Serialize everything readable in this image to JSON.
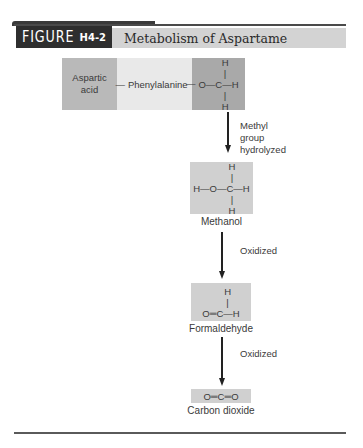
{
  "figure": {
    "label_word": "FIGURE",
    "label_number": "H4-2",
    "title": "Metabolism of Aspartame"
  },
  "aspartame": {
    "segment_1": "Aspartic\nacid",
    "bond_1": "—",
    "segment_2": "Phenylalanine",
    "bond_2": "—",
    "methyl_ester": "     H\n     |\nO—C—H\n     |\n     H"
  },
  "steps": [
    {
      "note": "Methyl\ngroup\nhydrolyzed"
    },
    {
      "note": "Oxidized"
    },
    {
      "note": "Oxidized"
    }
  ],
  "products": [
    {
      "name": "Methanol",
      "structure": "        H\n        |\nH—O—C—H\n        |\n        H"
    },
    {
      "name": "Formaldehyde",
      "structure": "     H\n     |\nO═C—H"
    },
    {
      "name": "Carbon dioxide",
      "structure": "O═C═O"
    }
  ],
  "colors": {
    "header_dark": "#2e2e2e",
    "title_band": "#d3d3d3",
    "box_fill": "#d0d0d0",
    "aspartic_fill": "#b9b9b9",
    "phenylalanine_fill": "#e9e9e9",
    "methyl_fill": "#a9a9a9"
  }
}
